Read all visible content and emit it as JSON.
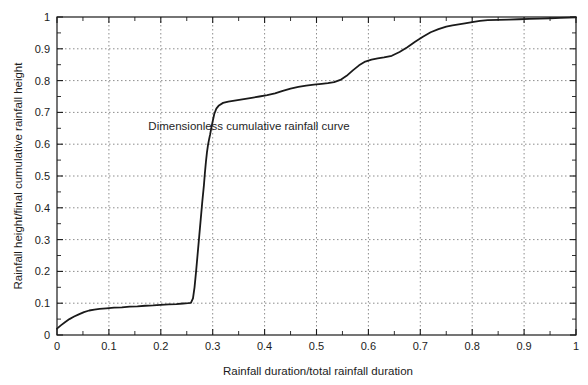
{
  "chart_data": {
    "type": "line",
    "title": "",
    "xlabel": "Rainfall duration/total rainfall duration",
    "ylabel": "Rainfall height/final cumulative rainfall height",
    "xlim": [
      0,
      1
    ],
    "ylim": [
      0,
      1
    ],
    "grid": true,
    "legend": "none",
    "annotations": [
      {
        "text": "Dimensionless cumulative rainfall curve",
        "x": 0.37,
        "y": 0.645
      }
    ],
    "xticks": [
      0,
      0.1,
      0.2,
      0.3,
      0.4,
      0.5,
      0.6,
      0.7,
      0.8,
      0.9,
      1
    ],
    "xtick_labels": [
      "0",
      "0.1",
      "0.2",
      "0.3",
      "0.4",
      "0.5",
      "0.6",
      "0.7",
      "0.8",
      "0.9",
      "1"
    ],
    "yticks": [
      0,
      0.1,
      0.2,
      0.3,
      0.4,
      0.5,
      0.6,
      0.7,
      0.8,
      0.9,
      1
    ],
    "ytick_labels": [
      "0",
      "0.1",
      "0.2",
      "0.3",
      "0.4",
      "0.5",
      "0.6",
      "0.7",
      "0.8",
      "0.9",
      "1"
    ],
    "minor_tick_step": 0.05,
    "series": [
      {
        "name": "Dimensionless cumulative rainfall curve",
        "color": "#1a1a1a",
        "width": 1.8,
        "x": [
          0.0,
          0.008,
          0.016,
          0.024,
          0.033,
          0.042,
          0.052,
          0.062,
          0.072,
          0.082,
          0.095,
          0.11,
          0.125,
          0.14,
          0.155,
          0.17,
          0.185,
          0.2,
          0.215,
          0.23,
          0.243,
          0.252,
          0.258,
          0.262,
          0.265,
          0.268,
          0.271,
          0.274,
          0.277,
          0.28,
          0.283,
          0.285,
          0.287,
          0.289,
          0.291,
          0.293,
          0.295,
          0.297,
          0.3,
          0.303,
          0.307,
          0.312,
          0.32,
          0.33,
          0.345,
          0.36,
          0.375,
          0.39,
          0.405,
          0.42,
          0.435,
          0.45,
          0.465,
          0.48,
          0.495,
          0.51,
          0.522,
          0.534,
          0.546,
          0.558,
          0.57,
          0.582,
          0.594,
          0.606,
          0.618,
          0.63,
          0.645,
          0.66,
          0.675,
          0.69,
          0.705,
          0.72,
          0.735,
          0.75,
          0.762,
          0.774,
          0.786,
          0.8,
          0.815,
          0.83,
          0.85,
          0.87,
          0.89,
          0.91,
          0.93,
          0.95,
          0.97,
          0.985,
          1.0
        ],
        "y": [
          0.02,
          0.031,
          0.041,
          0.05,
          0.058,
          0.065,
          0.072,
          0.077,
          0.08,
          0.082,
          0.084,
          0.086,
          0.087,
          0.089,
          0.09,
          0.092,
          0.093,
          0.095,
          0.096,
          0.097,
          0.099,
          0.1,
          0.101,
          0.115,
          0.15,
          0.2,
          0.255,
          0.31,
          0.365,
          0.42,
          0.47,
          0.51,
          0.545,
          0.575,
          0.598,
          0.615,
          0.63,
          0.648,
          0.672,
          0.695,
          0.712,
          0.722,
          0.73,
          0.734,
          0.738,
          0.742,
          0.746,
          0.75,
          0.754,
          0.76,
          0.768,
          0.775,
          0.78,
          0.784,
          0.787,
          0.79,
          0.792,
          0.795,
          0.802,
          0.815,
          0.832,
          0.848,
          0.86,
          0.866,
          0.87,
          0.873,
          0.878,
          0.89,
          0.905,
          0.922,
          0.938,
          0.952,
          0.962,
          0.97,
          0.974,
          0.977,
          0.98,
          0.984,
          0.988,
          0.99,
          0.991,
          0.992,
          0.993,
          0.994,
          0.995,
          0.996,
          0.997,
          0.998,
          0.999
        ]
      }
    ]
  },
  "colors": {
    "axis": "#1a1a1a",
    "grid": "#808080",
    "curve": "#1a1a1a",
    "text": "#1c1c1c",
    "background": "#ffffff"
  }
}
